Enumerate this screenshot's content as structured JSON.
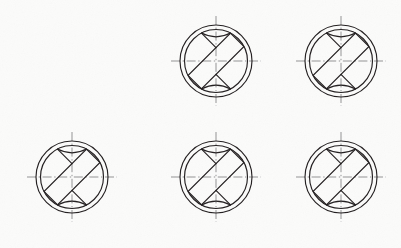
{
  "sheet": {
    "title": "Engineering drawing sheet",
    "description": "Six identical orthographic detail views of a circular housing with an inclined rectangular slot",
    "background_color": "#fbfbfa",
    "object_line_color": "#231f20",
    "center_line_color": "#8d8d8f",
    "width_px": 401,
    "height_px": 248,
    "columns": 3,
    "rows": 2
  },
  "geometry": {
    "outer_circle_radius": 36,
    "inner_circle_radius": 31.5,
    "slot_angle_deg": 45,
    "slot_half_width": 9.5,
    "slot_half_length": 30,
    "flank_arc_radius": 25.5,
    "centerline_overhang": 9
  },
  "figures": [
    {
      "id": "figure-1",
      "label": "View 1",
      "row": 1,
      "column": 1,
      "visible": false,
      "center_x": 70,
      "center_y": 62
    },
    {
      "id": "figure-2",
      "label": "View 2",
      "row": 1,
      "column": 2,
      "visible": true,
      "center_x": 216,
      "center_y": 61
    },
    {
      "id": "figure-3",
      "label": "View 3",
      "row": 1,
      "column": 3,
      "visible": true,
      "center_x": 341,
      "center_y": 61
    },
    {
      "id": "figure-4",
      "label": "View 4",
      "row": 2,
      "column": 1,
      "visible": true,
      "center_x": 72,
      "center_y": 177
    },
    {
      "id": "figure-5",
      "label": "View 5",
      "row": 2,
      "column": 2,
      "visible": true,
      "center_x": 216,
      "center_y": 177
    },
    {
      "id": "figure-6",
      "label": "View 6",
      "row": 2,
      "column": 3,
      "visible": true,
      "center_x": 341,
      "center_y": 177
    }
  ],
  "elements": {
    "outer_circle": "outer-circle",
    "inner_circle": "inner-circle",
    "slot": "inclined-slot",
    "upper_flank_arc": "upper-flank-arc",
    "lower_flank_arc": "lower-flank-arc",
    "vertical_centerline": "vertical-centerline",
    "horizontal_centerline": "horizontal-centerline"
  }
}
